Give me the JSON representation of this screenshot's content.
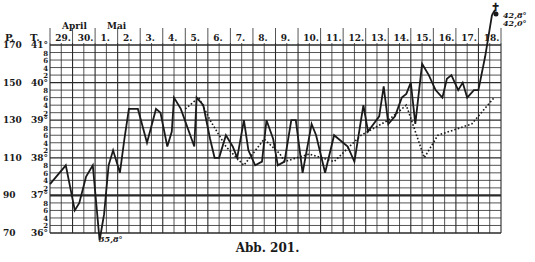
{
  "figure": {
    "caption": "Abb. 201.",
    "axis_headers": {
      "pulse": "P.",
      "temperature": "T."
    },
    "months": [
      {
        "label": "April",
        "x": 62
      },
      {
        "label": "Mai",
        "x": 107
      }
    ],
    "days": [
      "29.",
      "30.",
      "1.",
      "2.",
      "3.",
      "4.",
      "5.",
      "6.",
      "7.",
      "8.",
      "9.",
      "10.",
      "11.",
      "12.",
      "13.",
      "14.",
      "15.",
      "16.",
      "17.",
      "18."
    ],
    "temp_labels": [
      {
        "t": 41,
        "label": "41°",
        "pulse": "170"
      },
      {
        "t": 40.8,
        "label": "8"
      },
      {
        "t": 40.6,
        "label": "6"
      },
      {
        "t": 40.4,
        "label": "4"
      },
      {
        "t": 40.2,
        "label": "2"
      },
      {
        "t": 40,
        "label": "40°",
        "pulse": "150"
      },
      {
        "t": 39.8,
        "label": "8"
      },
      {
        "t": 39.6,
        "label": "6"
      },
      {
        "t": 39.4,
        "label": "4"
      },
      {
        "t": 39.2,
        "label": "2"
      },
      {
        "t": 39,
        "label": "39°",
        "pulse": "130"
      },
      {
        "t": 38.8,
        "label": "8"
      },
      {
        "t": 38.6,
        "label": "6"
      },
      {
        "t": 38.4,
        "label": "4"
      },
      {
        "t": 38.2,
        "label": "2"
      },
      {
        "t": 38,
        "label": "38°",
        "pulse": "110"
      },
      {
        "t": 37.8,
        "label": "8"
      },
      {
        "t": 37.6,
        "label": "6"
      },
      {
        "t": 37.4,
        "label": "4"
      },
      {
        "t": 37.2,
        "label": "2"
      },
      {
        "t": 37,
        "label": "37°",
        "pulse": "90"
      },
      {
        "t": 36.8,
        "label": "8"
      },
      {
        "t": 36.6,
        "label": "6"
      },
      {
        "t": 36.4,
        "label": "4"
      },
      {
        "t": 36.2,
        "label": "2"
      },
      {
        "t": 36,
        "label": "36°",
        "pulse": "70"
      }
    ],
    "annotations": {
      "low_temp": "35,8°",
      "high_temp_1": "42,8°",
      "high_temp_2": "42,0°",
      "death_symbol": "✝"
    },
    "colors": {
      "ink": "#1a1a1a",
      "grid": "#2a2a2a",
      "background": "#ffffff"
    }
  },
  "chart_data": {
    "type": "line",
    "title": "Abb. 201.",
    "xlabel": "Datum (April 29. – Mai 18.), morgens/abends",
    "ylabel": "T. (°C) / P. (Puls)",
    "ylim": [
      36,
      41
    ],
    "y2lim": [
      70,
      170
    ],
    "y_ticks_temp": [
      "36°",
      "37°",
      "38°",
      "39°",
      "40°",
      "41°"
    ],
    "y_ticks_pulse": [
      70,
      90,
      110,
      130,
      150,
      170
    ],
    "categories": [
      "29.",
      "30.",
      "1.",
      "2.",
      "3.",
      "4.",
      "5.",
      "6.",
      "7.",
      "8.",
      "9.",
      "10.",
      "11.",
      "12.",
      "13.",
      "14.",
      "15.",
      "16.",
      "17.",
      "18."
    ],
    "grid": true,
    "series": [
      {
        "name": "Temperatur (solid)",
        "style": "solid",
        "points_day_temp": [
          [
            0.0,
            37.3
          ],
          [
            0.7,
            37.8
          ],
          [
            1.1,
            36.6
          ],
          [
            1.3,
            36.8
          ],
          [
            1.6,
            37.5
          ],
          [
            1.9,
            37.8
          ],
          [
            2.2,
            35.8
          ],
          [
            2.4,
            36.5
          ],
          [
            2.6,
            37.8
          ],
          [
            2.8,
            38.2
          ],
          [
            3.1,
            37.6
          ],
          [
            3.3,
            38.5
          ],
          [
            3.5,
            39.3
          ],
          [
            3.9,
            39.3
          ],
          [
            4.3,
            38.4
          ],
          [
            4.7,
            39.3
          ],
          [
            4.9,
            39.2
          ],
          [
            5.2,
            38.3
          ],
          [
            5.4,
            38.7
          ],
          [
            5.5,
            39.6
          ],
          [
            5.8,
            39.3
          ],
          [
            6.4,
            38.3
          ],
          [
            6.5,
            39.6
          ],
          [
            6.8,
            39.4
          ],
          [
            7.1,
            38.5
          ],
          [
            7.3,
            38.0
          ],
          [
            7.5,
            38.0
          ],
          [
            7.8,
            38.6
          ],
          [
            8.1,
            38.3
          ],
          [
            8.3,
            38.0
          ],
          [
            8.6,
            39.0
          ],
          [
            8.8,
            38.2
          ],
          [
            9.1,
            37.8
          ],
          [
            9.4,
            37.9
          ],
          [
            9.6,
            39.0
          ],
          [
            9.9,
            38.5
          ],
          [
            10.1,
            37.8
          ],
          [
            10.4,
            37.9
          ],
          [
            10.7,
            39.0
          ],
          [
            10.9,
            39.0
          ],
          [
            11.2,
            37.6
          ],
          [
            11.6,
            38.9
          ],
          [
            11.8,
            38.6
          ],
          [
            12.2,
            37.6
          ],
          [
            12.6,
            38.6
          ],
          [
            13.2,
            38.3
          ],
          [
            13.5,
            37.9
          ],
          [
            13.9,
            39.4
          ],
          [
            14.1,
            38.7
          ],
          [
            14.6,
            39.1
          ],
          [
            14.8,
            39.9
          ],
          [
            15.0,
            38.9
          ],
          [
            15.3,
            39.1
          ],
          [
            15.6,
            39.6
          ],
          [
            15.8,
            39.7
          ],
          [
            16.0,
            40.0
          ],
          [
            16.2,
            38.9
          ],
          [
            16.5,
            40.5
          ],
          [
            16.8,
            40.2
          ],
          [
            17.1,
            39.8
          ],
          [
            17.4,
            39.6
          ],
          [
            17.6,
            40.1
          ],
          [
            17.8,
            40.2
          ],
          [
            18.1,
            39.8
          ],
          [
            18.3,
            40.0
          ],
          [
            18.5,
            39.6
          ],
          [
            18.8,
            39.8
          ],
          [
            19.0,
            39.8
          ],
          [
            19.3,
            40.7
          ],
          [
            19.6,
            41.8
          ]
        ]
      },
      {
        "name": "Puls (dotted)",
        "style": "dotted",
        "points_day_temp": [
          [
            6.0,
            39.3
          ],
          [
            6.6,
            39.6
          ],
          [
            7.1,
            39.0
          ],
          [
            7.8,
            38.3
          ],
          [
            8.6,
            37.8
          ],
          [
            9.5,
            38.5
          ],
          [
            10.2,
            38.1
          ],
          [
            10.4,
            37.9
          ],
          [
            11.5,
            38.1
          ],
          [
            12.6,
            37.9
          ],
          [
            13.8,
            38.6
          ],
          [
            15.0,
            39.0
          ],
          [
            15.8,
            39.4
          ],
          [
            16.6,
            38.0
          ],
          [
            17.2,
            38.6
          ],
          [
            18.7,
            38.9
          ],
          [
            19.7,
            39.6
          ]
        ],
        "note": "Pulse curve plotted on shared grid (P. scale: 20 per degree, 37° = 90)"
      }
    ],
    "annotations": [
      {
        "text": "35,8°",
        "at": "Mai 1 morgens minimum"
      },
      {
        "text": "42,8°",
        "at": "Mai 18 end"
      },
      {
        "text": "42,0°",
        "at": "Mai 18 end"
      },
      {
        "text": "✝",
        "at": "Mai 18 end (death)"
      }
    ],
    "legend": null
  }
}
